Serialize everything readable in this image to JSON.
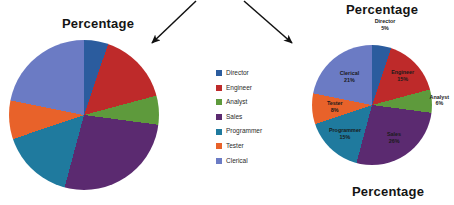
{
  "titles": {
    "left": "Percentage",
    "right_top": "Percentage",
    "right_bottom": "Percentage"
  },
  "legend": {
    "items": [
      {
        "label": "Director",
        "color": "#2B5C9E"
      },
      {
        "label": "Engineer",
        "color": "#BE2A2A"
      },
      {
        "label": "Analyst",
        "color": "#5E9A3C"
      },
      {
        "label": "Sales",
        "color": "#5B2A70"
      },
      {
        "label": "Programmer",
        "color": "#1F7A9E"
      },
      {
        "label": "Tester",
        "color": "#E8622A"
      },
      {
        "label": "Clerical",
        "color": "#6B7BC4"
      }
    ]
  },
  "data_labels": [
    {
      "name": "Director",
      "value": "5%",
      "text_color": "#1a1a1a"
    },
    {
      "name": "Engineer",
      "value": "15%",
      "text_color": "#1a1a1a"
    },
    {
      "name": "Analyst",
      "value": "6%",
      "text_color": "#1a1a1a"
    },
    {
      "name": "Sales",
      "value": "26%",
      "text_color": "#1a1a1a"
    },
    {
      "name": "Programmer",
      "value": "15%",
      "text_color": "#1a1a1a"
    },
    {
      "name": "Tester",
      "value": "8%",
      "text_color": "#1a1a1a"
    },
    {
      "name": "Clerical",
      "value": "21%",
      "text_color": "#1a1a1a"
    }
  ],
  "annotations": {
    "arrow_left": "arrow-down-left",
    "arrow_right": "arrow-down-right"
  },
  "chart_data": {
    "type": "pie",
    "title": "Percentage",
    "categories": [
      "Director",
      "Engineer",
      "Analyst",
      "Sales",
      "Programmer",
      "Tester",
      "Clerical"
    ],
    "values": [
      5,
      15,
      6,
      26,
      15,
      8,
      21
    ],
    "value_labels": [
      "5%",
      "15%",
      "6%",
      "26%",
      "15%",
      "8%",
      "21%"
    ],
    "colors": [
      "#2B5C9E",
      "#BE2A2A",
      "#5E9A3C",
      "#5B2A70",
      "#1F7A9E",
      "#E8622A",
      "#6B7BC4"
    ],
    "legend_position": "middle-center",
    "grid": false,
    "xlabel": "",
    "ylabel": ""
  }
}
